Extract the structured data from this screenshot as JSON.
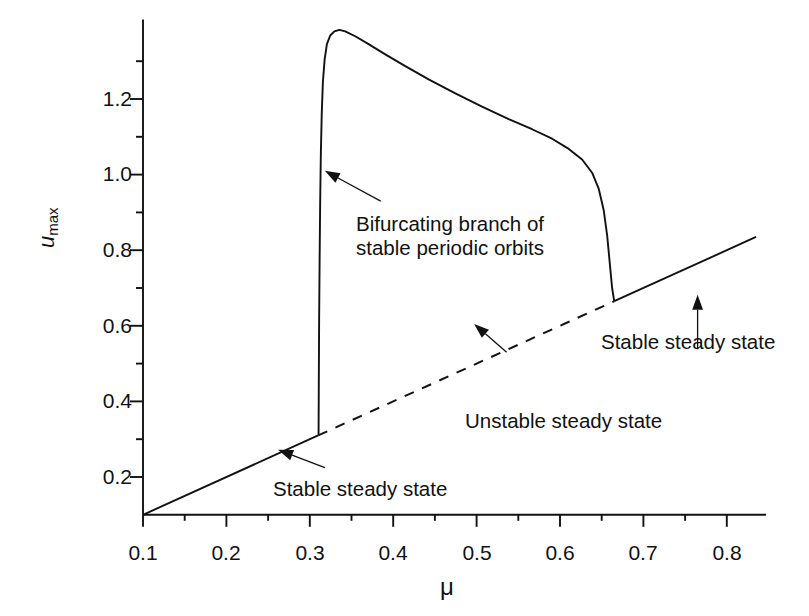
{
  "chart_data": {
    "type": "line",
    "title": "",
    "xlabel": "μ",
    "ylabel": "u_max",
    "xlim": [
      0.1,
      0.835
    ],
    "ylim": [
      0.1,
      1.41
    ],
    "grid": false,
    "legend_position": "none",
    "x_ticks": [
      0.1,
      0.2,
      0.3,
      0.4,
      0.5,
      0.6,
      0.7,
      0.8
    ],
    "x_tick_labels": [
      "0.1",
      "0.2",
      "0.3",
      "0.4",
      "0.5",
      "0.6",
      "0.7",
      "0.8"
    ],
    "x_minor_ticks": [
      0.15,
      0.25,
      0.35,
      0.45,
      0.55,
      0.65,
      0.75
    ],
    "y_ticks": [
      0.2,
      0.4,
      0.6,
      0.8,
      1.0,
      1.2
    ],
    "y_tick_labels": [
      "0.2",
      "0.4",
      "0.6",
      "0.8",
      "1.0",
      "1.2"
    ],
    "y_minor_ticks": [
      0.3,
      0.5,
      0.7,
      0.9,
      1.1,
      1.3
    ],
    "series": [
      {
        "name": "Stable steady state (lower branch)",
        "style": "solid",
        "points": [
          [
            0.1,
            0.1
          ],
          [
            0.31,
            0.31
          ]
        ]
      },
      {
        "name": "Unstable steady state",
        "style": "dashed",
        "points": [
          [
            0.31,
            0.31
          ],
          [
            0.665,
            0.665
          ]
        ]
      },
      {
        "name": "Stable steady state (upper branch)",
        "style": "solid",
        "points": [
          [
            0.665,
            0.665
          ],
          [
            0.835,
            0.835
          ]
        ]
      },
      {
        "name": "Bifurcating branch of stable periodic orbits",
        "style": "solid",
        "points": [
          [
            0.3105,
            0.312
          ],
          [
            0.3108,
            0.45
          ],
          [
            0.3112,
            0.62
          ],
          [
            0.3118,
            0.78
          ],
          [
            0.3124,
            0.92
          ],
          [
            0.3132,
            1.05
          ],
          [
            0.3143,
            1.16
          ],
          [
            0.3157,
            1.245
          ],
          [
            0.3178,
            1.305
          ],
          [
            0.3205,
            1.345
          ],
          [
            0.3245,
            1.368
          ],
          [
            0.3295,
            1.379
          ],
          [
            0.3355,
            1.383
          ],
          [
            0.3425,
            1.379
          ],
          [
            0.3545,
            1.366
          ],
          [
            0.3705,
            1.345
          ],
          [
            0.3905,
            1.318
          ],
          [
            0.4145,
            1.287
          ],
          [
            0.4425,
            1.252
          ],
          [
            0.4745,
            1.215
          ],
          [
            0.5065,
            1.18
          ],
          [
            0.5385,
            1.147
          ],
          [
            0.5665,
            1.12
          ],
          [
            0.5905,
            1.095
          ],
          [
            0.6105,
            1.068
          ],
          [
            0.6265,
            1.04
          ],
          [
            0.6385,
            1.005
          ],
          [
            0.6465,
            0.962
          ],
          [
            0.6525,
            0.905
          ],
          [
            0.6565,
            0.84
          ],
          [
            0.6595,
            0.77
          ],
          [
            0.6625,
            0.7
          ],
          [
            0.665,
            0.665
          ]
        ]
      }
    ],
    "annotations": [
      {
        "id": "bifurcating-branch",
        "text": "Bifurcating branch of\nstable periodic orbits",
        "text_x": 0.357,
        "text_y": 0.905,
        "arrow_from": [
          0.385,
          0.93
        ],
        "arrow_to": [
          0.318,
          1.01
        ]
      },
      {
        "id": "unstable-steady-state",
        "text": "Unstable steady state",
        "text_x": 0.543,
        "text_y": 0.496,
        "arrow_from": [
          0.536,
          0.53
        ],
        "arrow_to": [
          0.497,
          0.605
        ]
      },
      {
        "id": "stable-steady-state-lower",
        "text": "Stable steady state",
        "text_x": 0.323,
        "text_y": 0.205,
        "arrow_from": [
          0.318,
          0.225
        ],
        "arrow_to": [
          0.262,
          0.272
        ]
      },
      {
        "id": "stable-steady-state-upper",
        "text": "Stable steady state",
        "text_x": 0.65,
        "text_y": 0.458,
        "arrow_from": [
          0.765,
          0.538
        ],
        "arrow_to": [
          0.765,
          0.682
        ]
      }
    ],
    "colors": {
      "line": "#111111",
      "axis": "#111111",
      "background": "#ffffff"
    }
  },
  "labels": {
    "y_axis_var": "u",
    "y_axis_sub": "max",
    "x_axis_title": "μ",
    "ann_bifurcating_line1": "Bifurcating branch of",
    "ann_bifurcating_line2": "stable periodic orbits",
    "ann_unstable": "Unstable steady state",
    "ann_stable_lower": "Stable steady state",
    "ann_stable_upper": "Stable steady state",
    "ytick_0": "0.2",
    "ytick_1": "0.4",
    "ytick_2": "0.6",
    "ytick_3": "0.8",
    "ytick_4": "1.0",
    "ytick_5": "1.2",
    "xtick_0": "0.1",
    "xtick_1": "0.2",
    "xtick_2": "0.3",
    "xtick_3": "0.4",
    "xtick_4": "0.5",
    "xtick_5": "0.6",
    "xtick_6": "0.7",
    "xtick_7": "0.8"
  }
}
